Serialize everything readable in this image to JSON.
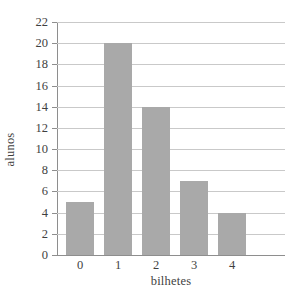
{
  "chart_data": {
    "type": "bar",
    "title": "",
    "xlabel": "bilhetes",
    "ylabel": "alunos",
    "categories": [
      "0",
      "1",
      "2",
      "3",
      "4"
    ],
    "values": [
      5,
      20,
      14,
      7,
      4
    ],
    "series": [
      {
        "name": "alunos",
        "values": [
          5,
          20,
          14,
          7,
          4
        ]
      }
    ],
    "ylim": [
      0,
      22
    ],
    "xlim": [
      -0.5,
      6.0
    ],
    "ytick_labels": [
      "0",
      "2",
      "4",
      "6",
      "8",
      "10",
      "12",
      "14",
      "16",
      "18",
      "20",
      "22"
    ],
    "ytick_values": [
      0,
      2,
      4,
      6,
      8,
      10,
      12,
      14,
      16,
      18,
      20,
      22
    ],
    "xtick_labels": [
      "0",
      "1",
      "2",
      "3",
      "4"
    ],
    "grid": "horizontal",
    "legend": "none",
    "bar_color": "#a9a9a9",
    "grid_color": "#c9c9c9",
    "axis_color": "#8e8e8e",
    "text_color": "#3f3f3f",
    "background": "#ffffff"
  }
}
